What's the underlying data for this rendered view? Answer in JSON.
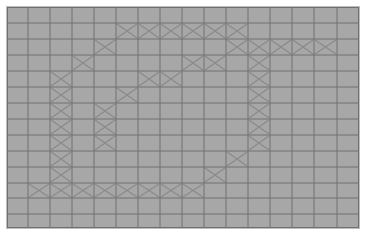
{
  "grid": {
    "columns": 16,
    "rows": 14,
    "col_lines": [
      0,
      21,
      43,
      65,
      87,
      109,
      131,
      153,
      175,
      197,
      219,
      241,
      263,
      285,
      307,
      330,
      352
    ],
    "row_lines": [
      0,
      16,
      32,
      48,
      64,
      80,
      96,
      112,
      128,
      144,
      160,
      176,
      191,
      207,
      221
    ],
    "colors": {
      "cell_fill": "#a7a7a7",
      "grid_line": "#707070",
      "mark": "#8a8a8a",
      "background": "#ffffff"
    }
  },
  "marked_cells": [
    [
      1,
      5
    ],
    [
      1,
      6
    ],
    [
      1,
      7
    ],
    [
      1,
      8
    ],
    [
      1,
      9
    ],
    [
      1,
      10
    ],
    [
      2,
      4
    ],
    [
      2,
      10
    ],
    [
      2,
      11
    ],
    [
      2,
      12
    ],
    [
      2,
      13
    ],
    [
      2,
      14
    ],
    [
      3,
      3
    ],
    [
      3,
      8
    ],
    [
      3,
      9
    ],
    [
      3,
      11
    ],
    [
      4,
      2
    ],
    [
      4,
      6
    ],
    [
      4,
      7
    ],
    [
      4,
      11
    ],
    [
      5,
      2
    ],
    [
      5,
      5
    ],
    [
      5,
      11
    ],
    [
      6,
      2
    ],
    [
      6,
      4
    ],
    [
      6,
      11
    ],
    [
      7,
      2
    ],
    [
      7,
      4
    ],
    [
      7,
      11
    ],
    [
      8,
      2
    ],
    [
      8,
      4
    ],
    [
      8,
      11
    ],
    [
      9,
      2
    ],
    [
      9,
      10
    ],
    [
      10,
      2
    ],
    [
      10,
      9
    ],
    [
      11,
      1
    ],
    [
      11,
      2
    ],
    [
      11,
      3
    ],
    [
      11,
      4
    ],
    [
      11,
      5
    ],
    [
      11,
      6
    ],
    [
      11,
      7
    ],
    [
      11,
      8
    ]
  ],
  "mark_icon": "x-mark-icon"
}
